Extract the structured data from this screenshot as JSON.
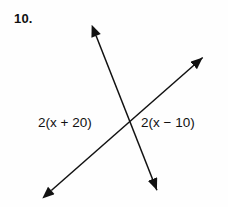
{
  "problem": {
    "number_label": "10.",
    "background_color": "#fefefe",
    "ink_color": "#111111"
  },
  "figure": {
    "type": "intersecting-lines-vertical-angles",
    "intersection": {
      "x": 128,
      "y": 124
    },
    "lines": [
      {
        "name": "line-a",
        "from": {
          "x": 93,
          "y": 28
        },
        "to": {
          "x": 160,
          "y": 198
        },
        "arrow_start": true,
        "arrow_end": true
      },
      {
        "name": "line-b",
        "from": {
          "x": 45,
          "y": 196
        },
        "to": {
          "x": 209,
          "y": 52
        },
        "arrow_start": true,
        "arrow_end": true
      }
    ],
    "stroke_width": 1.5,
    "arrowhead": {
      "length": 14,
      "width": 9,
      "style": "solid-triangle"
    }
  },
  "labels": {
    "left_expression": "2(x + 20)",
    "right_expression": "2(x − 10)"
  }
}
